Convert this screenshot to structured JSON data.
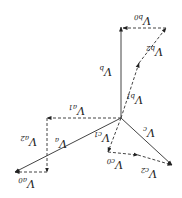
{
  "diagram": {
    "orientation": "rotated 180 degrees",
    "origin": [
      121,
      118
    ],
    "phasors": [
      {
        "id": "Va",
        "label": "V",
        "sub": "a",
        "style": "solid",
        "from": [
          121,
          118
        ],
        "to": [
          15,
          172
        ],
        "label_pos": [
          62,
          144
        ]
      },
      {
        "id": "Vb",
        "label": "V",
        "sub": "b",
        "style": "solid",
        "from": [
          121,
          118
        ],
        "to": [
          121,
          27
        ],
        "label_pos": [
          107,
          72
        ]
      },
      {
        "id": "Vc",
        "label": "V",
        "sub": "c",
        "style": "solid",
        "from": [
          121,
          118
        ],
        "to": [
          172,
          165
        ],
        "label_pos": [
          150,
          133
        ]
      },
      {
        "id": "Va1",
        "label": "V",
        "sub": "a1",
        "style": "dashed",
        "from": [
          121,
          118
        ],
        "to": [
          47,
          118
        ],
        "label_pos": [
          80,
          111
        ]
      },
      {
        "id": "Va2",
        "label": "V",
        "sub": "a2",
        "style": "dashed",
        "from": [
          47,
          118
        ],
        "to": [
          47,
          172
        ],
        "label_pos": [
          32,
          142
        ]
      },
      {
        "id": "Va0",
        "label": "V",
        "sub": "a0",
        "style": "dashed",
        "from": [
          47,
          172
        ],
        "to": [
          15,
          172
        ],
        "label_pos": [
          30,
          184
        ]
      },
      {
        "id": "Vb1",
        "label": "V",
        "sub": "b1",
        "style": "dashed",
        "from": [
          121,
          118
        ],
        "to": [
          139,
          63
        ],
        "label_pos": [
          138,
          100
        ]
      },
      {
        "id": "Vb2",
        "label": "V",
        "sub": "b2",
        "style": "dashed",
        "from": [
          139,
          63
        ],
        "to": [
          166,
          28
        ],
        "label_pos": [
          158,
          52
        ]
      },
      {
        "id": "Vb0",
        "label": "V",
        "sub": "b0",
        "style": "dashed",
        "from": [
          166,
          28
        ],
        "to": [
          123,
          28
        ],
        "label_pos": [
          146,
          21
        ]
      },
      {
        "id": "Vc1",
        "label": "V",
        "sub": "c1",
        "style": "dashed",
        "from": [
          121,
          118
        ],
        "to": [
          108,
          152
        ],
        "label_pos": [
          105,
          138
        ]
      },
      {
        "id": "Vc0",
        "label": "V",
        "sub": "c0",
        "style": "dashed",
        "from": [
          108,
          152
        ],
        "to": [
          138,
          155
        ],
        "label_pos": [
          118,
          165
        ]
      },
      {
        "id": "Vc2",
        "label": "V",
        "sub": "c2",
        "style": "dashed",
        "from": [
          138,
          155
        ],
        "to": [
          172,
          165
        ],
        "label_pos": [
          152,
          174
        ]
      }
    ],
    "colors": {
      "stroke": "#444444",
      "text": "#222222",
      "background": "#ffffff"
    }
  }
}
